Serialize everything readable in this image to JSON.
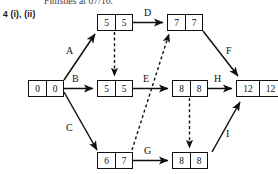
{
  "page": {
    "top_note": "Finishes at 07/16.",
    "question_label": "4 (i), (ii)"
  },
  "diagram": {
    "type": "activity-on-arrow-network",
    "colors": {
      "line": "#111111",
      "node_border": "#111111",
      "background": "#ffffff",
      "text": "#111111"
    },
    "nodes": [
      {
        "id": "start",
        "early": "0",
        "late": "0",
        "x": 28,
        "y": 80,
        "cells": 2
      },
      {
        "id": "top-left",
        "early": "5",
        "late": "5",
        "x": 97,
        "y": 14,
        "cells": 2
      },
      {
        "id": "top-right",
        "early": "7",
        "late": "7",
        "x": 167,
        "y": 14,
        "cells": 2
      },
      {
        "id": "mid-center",
        "early": "5",
        "late": "5",
        "x": 97,
        "y": 80,
        "cells": 2
      },
      {
        "id": "mid-right",
        "early": "8",
        "late": "8",
        "x": 172,
        "y": 80,
        "cells": 2
      },
      {
        "id": "end",
        "early": "12",
        "late": "12",
        "x": 236,
        "y": 80,
        "cells": 2
      },
      {
        "id": "bottom-left",
        "early": "6",
        "late": "7",
        "x": 97,
        "y": 152,
        "cells": 2
      },
      {
        "id": "bottom-right",
        "early": "8",
        "late": "8",
        "x": 172,
        "y": 152,
        "cells": 2
      }
    ],
    "edges": [
      {
        "label": "A",
        "from": "start",
        "to": "top-left",
        "style": "solid"
      },
      {
        "label": "B",
        "from": "start",
        "to": "mid-center",
        "style": "solid"
      },
      {
        "label": "C",
        "from": "start",
        "to": "bottom-left",
        "style": "solid"
      },
      {
        "label": "D",
        "from": "top-left",
        "to": "top-right",
        "style": "solid"
      },
      {
        "label": "E",
        "from": "mid-center",
        "to": "mid-right",
        "style": "solid"
      },
      {
        "label": "F",
        "from": "top-right",
        "to": "end",
        "style": "solid"
      },
      {
        "label": "G",
        "from": "bottom-left",
        "to": "bottom-right",
        "style": "solid"
      },
      {
        "label": "H",
        "from": "mid-right",
        "to": "end",
        "style": "solid"
      },
      {
        "label": "I",
        "from": "bottom-right",
        "to": "end",
        "style": "solid"
      },
      {
        "label": "",
        "from": "top-left",
        "to": "mid-center",
        "style": "dashed"
      },
      {
        "label": "",
        "from": "mid-right",
        "to": "bottom-right",
        "style": "dashed"
      },
      {
        "label": "",
        "from": "bottom-left",
        "to": "top-right",
        "style": "dashed"
      }
    ],
    "edge_labels": {
      "A": "A",
      "B": "B",
      "C": "C",
      "D": "D",
      "E": "E",
      "F": "F",
      "G": "G",
      "H": "H",
      "I": "I"
    }
  }
}
